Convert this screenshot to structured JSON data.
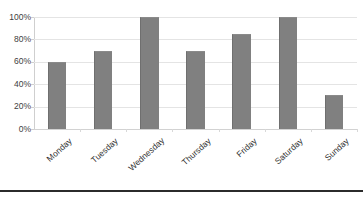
{
  "chart_data": {
    "type": "bar",
    "title": "",
    "xlabel": "",
    "ylabel": "",
    "categories": [
      "Monday",
      "Tuesday",
      "Wednesday",
      "Thursday",
      "Friday",
      "Saturday",
      "Sunday"
    ],
    "values": [
      60,
      70,
      100,
      70,
      85,
      100,
      30
    ],
    "series": [
      {
        "name": "",
        "values": [
          60,
          70,
          100,
          70,
          85,
          100,
          30
        ]
      }
    ],
    "ylim": [
      0,
      100
    ],
    "y_ticks": [
      0,
      20,
      40,
      60,
      80,
      100
    ],
    "y_tick_labels": [
      "0%",
      "20%",
      "40%",
      "60%",
      "80%",
      "100%"
    ],
    "grid": true,
    "legend": false,
    "legend_position": "none",
    "value_format": "percent",
    "bar_color": "#808080",
    "gridline_color": "#e4e4e4",
    "axis_color": "#cfcfcf",
    "text_color": "#303030",
    "background_color": "#ffffff"
  }
}
